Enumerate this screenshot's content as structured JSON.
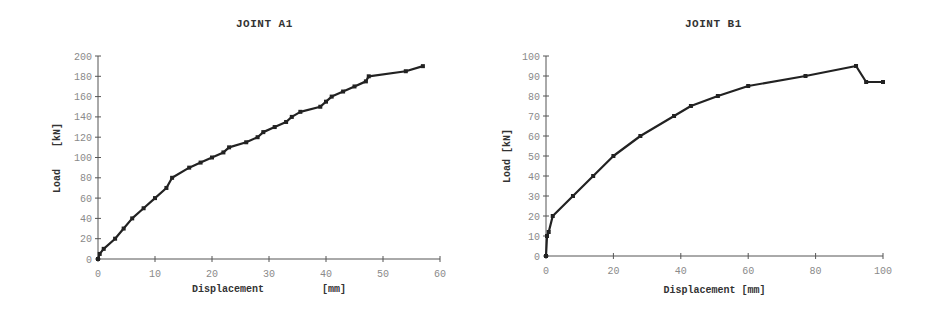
{
  "chart_data": [
    {
      "type": "line",
      "title": "JOINT A1",
      "xlabel": "Displacement [mm]",
      "xlabel_parts": [
        "Displacement",
        "[mm]"
      ],
      "ylabel": "Load [kN]",
      "ylabel_parts": [
        "Load",
        "[kN]"
      ],
      "xlim": [
        0,
        60
      ],
      "ylim": [
        0,
        200
      ],
      "xticks": [
        0,
        10,
        20,
        30,
        40,
        50,
        60
      ],
      "yticks": [
        0,
        20,
        40,
        60,
        80,
        100,
        120,
        140,
        160,
        180,
        200
      ],
      "grid": false,
      "legend": null,
      "series": [
        {
          "name": "Joint A1",
          "color": "#222222",
          "marker": "square",
          "x": [
            0,
            0.3,
            1,
            3,
            4.5,
            6,
            8,
            10,
            12,
            13,
            16,
            18,
            20,
            22,
            23,
            26,
            28,
            29,
            31,
            33,
            34,
            35.5,
            39,
            40,
            41,
            43,
            45,
            47,
            47.5,
            54,
            57
          ],
          "y": [
            0,
            5,
            10,
            20,
            30,
            40,
            50,
            60,
            70,
            80,
            90,
            95,
            100,
            105,
            110,
            115,
            120,
            125,
            130,
            135,
            140,
            145,
            150,
            155,
            160,
            165,
            170,
            175,
            180,
            185,
            190
          ]
        }
      ]
    },
    {
      "type": "line",
      "title": "JOINT B1",
      "xlabel": "Displacement [mm]",
      "ylabel": "Load [kN]",
      "xlim": [
        0,
        100
      ],
      "ylim": [
        0,
        100
      ],
      "xticks": [
        0,
        20,
        40,
        60,
        80,
        100
      ],
      "yticks": [
        0,
        10,
        20,
        30,
        40,
        50,
        60,
        70,
        80,
        90,
        100
      ],
      "grid": false,
      "legend": null,
      "series": [
        {
          "name": "Joint B1",
          "color": "#222222",
          "marker": "square",
          "x": [
            0,
            0.3,
            0.8,
            2,
            8,
            14,
            20,
            28,
            38,
            43,
            51,
            60,
            77,
            92,
            95,
            100
          ],
          "y": [
            0,
            10,
            12,
            20,
            30,
            40,
            50,
            60,
            70,
            75,
            80,
            85,
            90,
            95,
            87,
            87
          ]
        }
      ]
    }
  ]
}
